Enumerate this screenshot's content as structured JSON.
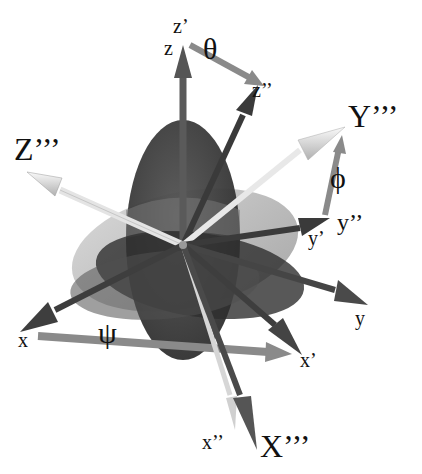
{
  "figure": {
    "colors": {
      "background": "#ffffff",
      "original_axes": "#4a4a4a",
      "intermediate_axes": "#3a3a3a",
      "final_axes": "#e8e8e8",
      "rotation_arrows": "#8a8a8a",
      "disc_dark": "#3c3c3c",
      "disc_mid": "#6e6e6e",
      "disc_light": "#b8b8b8"
    },
    "labels": {
      "z": "z",
      "z_prime": "z’",
      "z_double": "z’’",
      "y": "y",
      "y_prime": "y’",
      "y_double": "y’’",
      "x": "x",
      "x_prime": "x’",
      "x_double": "x’’",
      "X_triple": "X’’’",
      "Y_triple": "Y’’’",
      "Z_triple": "Z’’’"
    },
    "angles": {
      "theta": "θ",
      "phi": "ϕ",
      "psi": "ψ"
    }
  }
}
